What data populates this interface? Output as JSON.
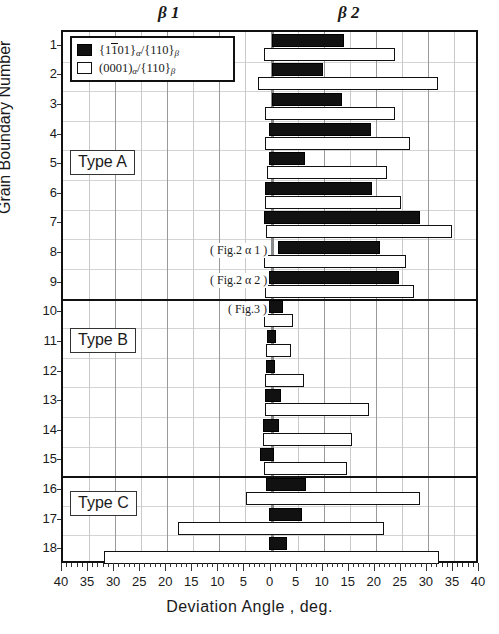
{
  "header": {
    "beta1_label": "β 1",
    "beta2_label": "β 2"
  },
  "axes": {
    "x_title": "Deviation Angle ,   deg.",
    "y_title": "Grain Boundary Number",
    "x_tick_labels": [
      "40",
      "35",
      "30",
      "25",
      "20",
      "15",
      "10",
      "5",
      "0",
      "5",
      "10",
      "15",
      "20",
      "25",
      "30",
      "35",
      "40"
    ],
    "y_tick_labels": [
      "1",
      "2",
      "3",
      "4",
      "5",
      "6",
      "7",
      "8",
      "9",
      "10",
      "11",
      "12",
      "13",
      "14",
      "15",
      "16",
      "17",
      "18"
    ]
  },
  "legend": {
    "items": [
      {
        "swatch": "filled-square",
        "prefix": "{1",
        "overbar": "1",
        "suffix": "01}",
        "sub1": "α",
        "sep": "/{110}",
        "sub2": "β"
      },
      {
        "swatch": "open-square",
        "prefix": "(0001)",
        "overbar": "",
        "suffix": "",
        "sub1": "α",
        "sep": "/{110}",
        "sub2": "β"
      }
    ]
  },
  "type_boxes": [
    {
      "label": "Type A",
      "row": 5
    },
    {
      "label": "Type B",
      "row": 11
    },
    {
      "label": "Type C",
      "row": 16.5
    }
  ],
  "annotations": [
    {
      "text": "( Fig.2  α 1 )",
      "row": 8
    },
    {
      "text": "( Fig.2  α 2 )",
      "row": 9
    },
    {
      "text": "( Fig.3 )",
      "row": 10
    }
  ],
  "group_separators": [
    9.5,
    15.5
  ],
  "chart_data": {
    "type": "bar",
    "title": "",
    "xlabel": "Deviation Angle ,   deg.",
    "ylabel": "Grain Boundary Number",
    "xlim": [
      -40,
      40
    ],
    "x_center_is_zero": true,
    "orientation": "horizontal",
    "grid": true,
    "legend_position": "top-left",
    "categories": [
      1,
      2,
      3,
      4,
      5,
      6,
      7,
      8,
      9,
      10,
      11,
      12,
      13,
      14,
      15,
      16,
      17,
      18
    ],
    "series": [
      {
        "name": "{1-101}a/{110}b",
        "style": "filled",
        "bars": [
          {
            "row": 1,
            "start": 0.0,
            "end": 14.0
          },
          {
            "row": 2,
            "start": 0.0,
            "end": 9.8
          },
          {
            "row": 3,
            "start": 0.0,
            "end": 13.5
          },
          {
            "row": 4,
            "start": -0.5,
            "end": 19.0
          },
          {
            "row": 5,
            "start": -0.5,
            "end": 6.5
          },
          {
            "row": 6,
            "start": -1.3,
            "end": 19.2
          },
          {
            "row": 7,
            "start": -1.5,
            "end": 28.4
          },
          {
            "row": 8,
            "start": 1.2,
            "end": 20.8
          },
          {
            "row": 9,
            "start": -0.4,
            "end": 24.4
          },
          {
            "row": 10,
            "start": -0.4,
            "end": 2.3
          },
          {
            "row": 11,
            "start": -0.8,
            "end": 0.8
          },
          {
            "row": 12,
            "start": -1.0,
            "end": 0.6
          },
          {
            "row": 13,
            "start": -1.3,
            "end": 1.9
          },
          {
            "row": 14,
            "start": -1.7,
            "end": 1.5
          },
          {
            "row": 15,
            "start": -2.3,
            "end": 0.4
          },
          {
            "row": 16,
            "start": -1.0,
            "end": 6.7
          },
          {
            "row": 17,
            "start": -0.4,
            "end": 5.8
          },
          {
            "row": 18,
            "start": -0.4,
            "end": 2.9
          }
        ]
      },
      {
        "name": "(0001)a/{110}b",
        "style": "open",
        "bars": [
          {
            "row": 1,
            "start": -1.5,
            "end": 23.6
          },
          {
            "row": 2,
            "start": -2.5,
            "end": 31.9
          },
          {
            "row": 3,
            "start": -1.3,
            "end": 23.6
          },
          {
            "row": 4,
            "start": -1.2,
            "end": 26.5
          },
          {
            "row": 5,
            "start": -0.8,
            "end": 22.1
          },
          {
            "row": 6,
            "start": -1.3,
            "end": 24.9
          },
          {
            "row": 7,
            "start": -1.0,
            "end": 34.6
          },
          {
            "row": 8,
            "start": -1.5,
            "end": 25.9
          },
          {
            "row": 9,
            "start": -1.3,
            "end": 27.3
          },
          {
            "row": 10,
            "start": -1.5,
            "end": 4.2
          },
          {
            "row": 11,
            "start": -1.0,
            "end": 3.8
          },
          {
            "row": 12,
            "start": -1.2,
            "end": 6.3
          },
          {
            "row": 13,
            "start": -1.3,
            "end": 18.8
          },
          {
            "row": 14,
            "start": -1.7,
            "end": 15.4
          },
          {
            "row": 15,
            "start": -1.5,
            "end": 14.4
          },
          {
            "row": 16,
            "start": -4.8,
            "end": 28.4
          },
          {
            "row": 17,
            "start": -18.0,
            "end": 21.5
          },
          {
            "row": 18,
            "start": -32.2,
            "end": 32.1
          }
        ]
      }
    ]
  }
}
